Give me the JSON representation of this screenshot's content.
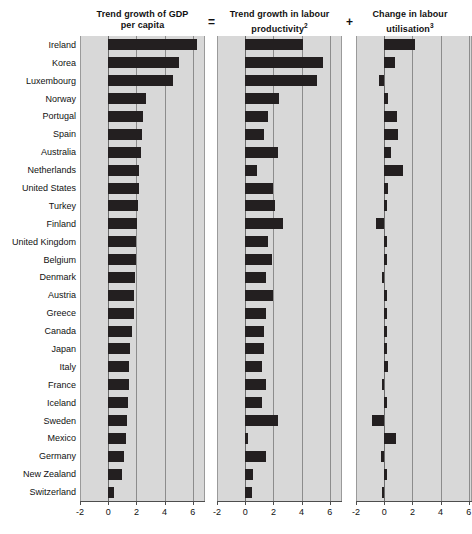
{
  "chart_data": {
    "type": "bar",
    "orientation": "horizontal",
    "grid": true,
    "xlim": [
      -2,
      7
    ],
    "xticks": [
      -2,
      0,
      2,
      4,
      6
    ],
    "xticklabels": [
      "-2",
      "0",
      "2",
      "4",
      "6"
    ],
    "categories": [
      "Ireland",
      "Korea",
      "Luxembourg",
      "Norway",
      "Portugal",
      "Spain",
      "Australia",
      "Netherlands",
      "United States",
      "Turkey",
      "Finland",
      "United Kingdom",
      "Belgium",
      "Denmark",
      "Austria",
      "Greece",
      "Canada",
      "Japan",
      "Italy",
      "France",
      "Iceland",
      "Sweden",
      "Mexico",
      "Germany",
      "New Zealand",
      "Switzerland"
    ],
    "panels": [
      {
        "id": "gdp-per-capita",
        "title_line1": "Trend growth of GDP",
        "title_line2": "per capita",
        "footnote": "",
        "operator_after": "=",
        "values": [
          6.3,
          5.0,
          4.6,
          2.7,
          2.5,
          2.4,
          2.3,
          2.2,
          2.15,
          2.1,
          2.05,
          2.0,
          1.95,
          1.9,
          1.85,
          1.8,
          1.7,
          1.55,
          1.5,
          1.45,
          1.4,
          1.3,
          1.25,
          1.15,
          0.95,
          0.4
        ]
      },
      {
        "id": "labour-productivity",
        "title_line1": "Trend growth in labour",
        "title_line2": "productivity",
        "footnote": "2",
        "operator_after": "+",
        "values": [
          4.1,
          5.5,
          5.1,
          2.4,
          1.6,
          1.3,
          2.3,
          0.85,
          2.0,
          2.1,
          2.7,
          1.6,
          1.9,
          1.5,
          1.95,
          1.5,
          1.3,
          1.35,
          1.2,
          1.5,
          1.2,
          2.35,
          0.1,
          1.45,
          0.55,
          0.45
        ]
      },
      {
        "id": "labour-utilisation",
        "title_line1": "Change in labour",
        "title_line2": "utilisation",
        "footnote": "3",
        "operator_after": "",
        "values": [
          2.2,
          0.8,
          -0.35,
          0.25,
          0.9,
          1.0,
          0.5,
          1.35,
          0.25,
          0.1,
          -0.6,
          0.15,
          0.1,
          -0.05,
          0.1,
          0.15,
          0.2,
          0.15,
          0.25,
          -0.1,
          0.2,
          -0.85,
          0.85,
          -0.25,
          0.2,
          -0.1
        ]
      }
    ],
    "colors": {
      "bar": "#231f20",
      "panel_background": "#d8d8d8",
      "gridline": "#8c8c8c",
      "axis": "#4d4d4d",
      "text": "#111111",
      "page_background": "#ffffff"
    }
  }
}
